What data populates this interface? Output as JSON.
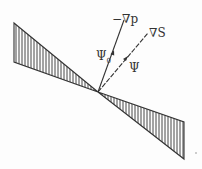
{
  "diagram": {
    "labels": {
      "neg_grad_p": "−∇p",
      "grad_s": "∇S",
      "psi_0": "Ψ",
      "psi_0_sub": "0",
      "psi": "Ψ"
    },
    "colors": {
      "ink": "#333333",
      "background": "#fdfdfd"
    },
    "geometry": {
      "apex": [
        98,
        92
      ],
      "left_wedge": [
        [
          14,
          23
        ],
        [
          14,
          62
        ],
        [
          98,
          92
        ]
      ],
      "right_wedge": [
        [
          98,
          92
        ],
        [
          184,
          122
        ],
        [
          184,
          159
        ]
      ],
      "neg_grad_p_end": [
        124,
        20
      ],
      "grad_s_end": [
        148,
        33
      ]
    }
  }
}
